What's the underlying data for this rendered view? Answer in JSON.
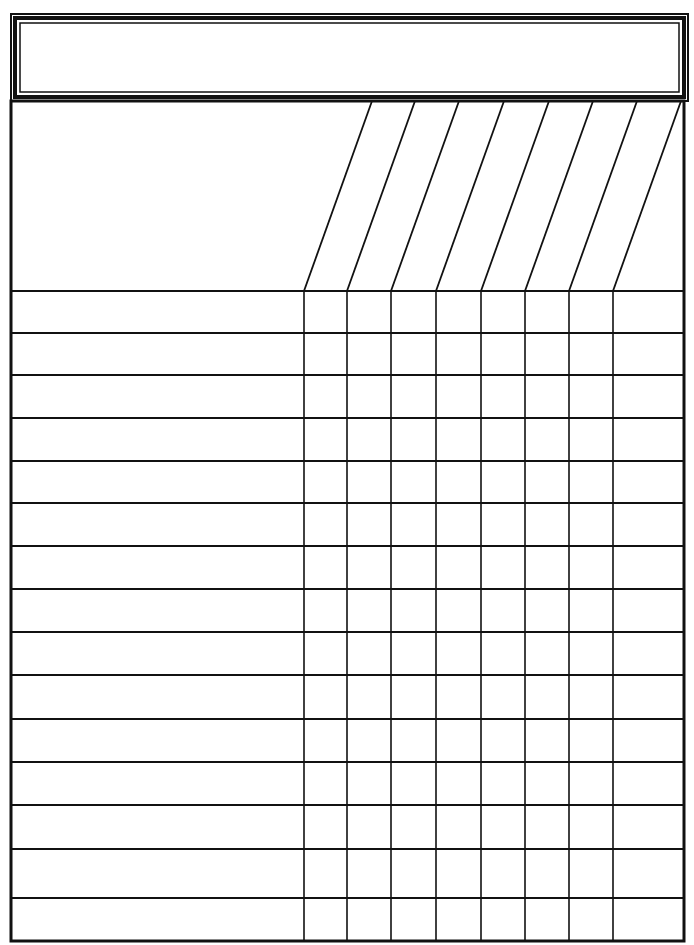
{
  "page": {
    "width": 694,
    "height": 945,
    "background": "#ffffff",
    "line_color": "#111111"
  },
  "title_box": {
    "text": "",
    "outer": {
      "x": 11,
      "y": 14,
      "w": 677,
      "h": 87
    },
    "middle": {
      "x": 15,
      "y": 18,
      "w": 669,
      "h": 79
    },
    "inner": {
      "x": 20,
      "y": 23,
      "w": 659,
      "h": 69
    }
  },
  "grid": {
    "frame": {
      "x": 11,
      "y": 101,
      "w": 673,
      "h": 840
    },
    "label_column": {
      "x_left": 11,
      "x_right": 304
    },
    "header_row": {
      "y_top": 101,
      "y_bottom": 291
    },
    "column_lines_bottom_x": [
      304,
      347,
      391,
      436,
      481,
      525,
      569,
      613
    ],
    "column_lines_top_x": [
      372,
      415,
      459,
      504,
      549,
      593,
      637,
      681
    ],
    "row_lines_y": [
      291,
      333,
      375,
      418,
      461,
      503,
      546,
      589,
      632,
      675,
      719,
      762,
      805,
      849,
      898,
      941
    ],
    "column_headers": [
      "",
      "",
      "",
      "",
      "",
      "",
      "",
      ""
    ],
    "rows": [
      {
        "label": "",
        "cells": [
          "",
          "",
          "",
          "",
          "",
          "",
          "",
          ""
        ]
      },
      {
        "label": "",
        "cells": [
          "",
          "",
          "",
          "",
          "",
          "",
          "",
          ""
        ]
      },
      {
        "label": "",
        "cells": [
          "",
          "",
          "",
          "",
          "",
          "",
          "",
          ""
        ]
      },
      {
        "label": "",
        "cells": [
          "",
          "",
          "",
          "",
          "",
          "",
          "",
          ""
        ]
      },
      {
        "label": "",
        "cells": [
          "",
          "",
          "",
          "",
          "",
          "",
          "",
          ""
        ]
      },
      {
        "label": "",
        "cells": [
          "",
          "",
          "",
          "",
          "",
          "",
          "",
          ""
        ]
      },
      {
        "label": "",
        "cells": [
          "",
          "",
          "",
          "",
          "",
          "",
          "",
          ""
        ]
      },
      {
        "label": "",
        "cells": [
          "",
          "",
          "",
          "",
          "",
          "",
          "",
          ""
        ]
      },
      {
        "label": "",
        "cells": [
          "",
          "",
          "",
          "",
          "",
          "",
          "",
          ""
        ]
      },
      {
        "label": "",
        "cells": [
          "",
          "",
          "",
          "",
          "",
          "",
          "",
          ""
        ]
      },
      {
        "label": "",
        "cells": [
          "",
          "",
          "",
          "",
          "",
          "",
          "",
          ""
        ]
      },
      {
        "label": "",
        "cells": [
          "",
          "",
          "",
          "",
          "",
          "",
          "",
          ""
        ]
      },
      {
        "label": "",
        "cells": [
          "",
          "",
          "",
          "",
          "",
          "",
          "",
          ""
        ]
      },
      {
        "label": "",
        "cells": [
          "",
          "",
          "",
          "",
          "",
          "",
          "",
          ""
        ]
      },
      {
        "label": "",
        "cells": [
          "",
          "",
          "",
          "",
          "",
          "",
          "",
          ""
        ]
      }
    ]
  }
}
